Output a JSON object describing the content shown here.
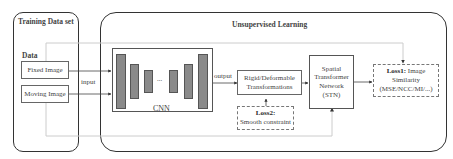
{
  "training_panel": {
    "title": "Training Data set",
    "data_label": "Data",
    "fixed_image": "Fixed Image",
    "moving_image": "Moving Image"
  },
  "unsupervised_panel": {
    "title": "Unsupervised Learning"
  },
  "edges": {
    "input": "input",
    "output": "output"
  },
  "cnn": {
    "label": "CNN",
    "ellipsis": "..."
  },
  "transform": {
    "line1": "Rigid/Deformable",
    "line2": "Transformations"
  },
  "stn": {
    "line1": "Spatial",
    "line2": "Transformer",
    "line3": "Network",
    "line4": "(STN)"
  },
  "loss1": {
    "title": "Loss1:",
    "line1": "Image",
    "line2": "Similarity",
    "line3": "(MSE/NCC/MI/...)"
  },
  "loss2": {
    "title": "Loss2:",
    "line1": "Smooth constraint"
  }
}
